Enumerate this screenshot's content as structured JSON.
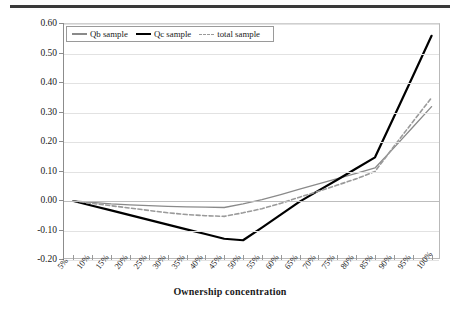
{
  "figure": {
    "top_rule": true,
    "background": "#ffffff"
  },
  "axes": {
    "y_title": "Tobin's Q",
    "x_title": "Ownership concentration",
    "y_ticks": [
      "0.60",
      "0.50",
      "0.40",
      "0.30",
      "0.20",
      "0.10",
      "0.00",
      "-0.10",
      "-0.20"
    ],
    "y_tick_values": [
      0.6,
      0.5,
      0.4,
      0.3,
      0.2,
      0.1,
      0.0,
      -0.1,
      -0.2
    ],
    "x_ticks": [
      "5%",
      "10%",
      "15%",
      "20%",
      "25%",
      "30%",
      "35%",
      "40%",
      "45%",
      "50%",
      "55%",
      "60%",
      "65%",
      "70%",
      "75%",
      "80%",
      "85%",
      "90%",
      "95%",
      "100%"
    ]
  },
  "legend": {
    "position": "top-left-inside",
    "items": [
      {
        "label": "Qb sample",
        "style": "solid",
        "color": "#8a8a8a",
        "icon": "line-swatch-icon"
      },
      {
        "label": "Qc sample",
        "style": "solid-bold",
        "color": "#000000",
        "icon": "line-swatch-icon"
      },
      {
        "label": "total sample",
        "style": "dashed",
        "color": "#9a9a9a",
        "icon": "dashed-line-swatch-icon"
      }
    ]
  },
  "colors": {
    "qb": "#8a8a8a",
    "qc": "#000000",
    "total": "#9a9a9a",
    "grid": "#e2e2e2",
    "axis": "#8c8c8c"
  },
  "chart_data": {
    "type": "line",
    "title": "",
    "xlabel": "Ownership concentration",
    "ylabel": "Tobin's Q",
    "x": [
      "5%",
      "10%",
      "15%",
      "20%",
      "25%",
      "30%",
      "35%",
      "40%",
      "45%",
      "50%",
      "55%",
      "60%",
      "65%",
      "70%",
      "75%",
      "80%",
      "85%",
      "90%",
      "95%",
      "100%"
    ],
    "ylim": [
      -0.2,
      0.6
    ],
    "xlim_categories": 20,
    "grid": true,
    "legend_position": "upper left",
    "series": [
      {
        "name": "Qb sample",
        "style": "solid",
        "color": "#8a8a8a",
        "values": [
          0.0,
          -0.005,
          -0.01,
          -0.013,
          -0.016,
          -0.018,
          -0.02,
          -0.021,
          -0.022,
          -0.01,
          0.005,
          0.022,
          0.04,
          0.058,
          0.076,
          0.094,
          0.112,
          0.18,
          0.25,
          0.32
        ]
      },
      {
        "name": "Qc sample",
        "style": "solid-bold",
        "color": "#000000",
        "values": [
          0.0,
          -0.016,
          -0.032,
          -0.048,
          -0.064,
          -0.08,
          -0.096,
          -0.112,
          -0.128,
          -0.133,
          -0.09,
          -0.046,
          -0.002,
          0.035,
          0.072,
          0.11,
          0.148,
          0.285,
          0.422,
          0.56
        ]
      },
      {
        "name": "total sample",
        "style": "dashed",
        "color": "#9a9a9a",
        "values": [
          0.0,
          -0.008,
          -0.016,
          -0.024,
          -0.032,
          -0.04,
          -0.046,
          -0.05,
          -0.052,
          -0.04,
          -0.026,
          -0.008,
          0.013,
          0.033,
          0.054,
          0.075,
          0.1,
          0.185,
          0.268,
          0.35
        ]
      }
    ]
  }
}
